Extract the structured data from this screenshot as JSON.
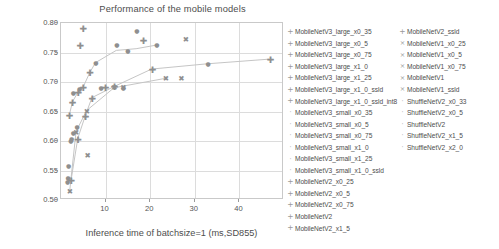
{
  "chart_data": {
    "type": "scatter",
    "title": "Performance of the mobile models",
    "xlabel": "Inference time of batchsize=1  (ms,SD855)",
    "ylabel": "Accuracy",
    "xlim": [
      0,
      50
    ],
    "ylim": [
      0.5,
      0.8
    ],
    "xticks": [
      10,
      20,
      30,
      40
    ],
    "xtick_labels": [
      "10",
      "20",
      "30",
      "40"
    ],
    "yticks": [
      0.5,
      0.55,
      0.6,
      0.65,
      0.7,
      0.75,
      0.8
    ],
    "ytick_labels": [
      "0.50",
      "0.55",
      "0.60",
      "0.65",
      "0.70",
      "0.75",
      "0.80"
    ],
    "grid": true,
    "legend_position": "right",
    "marker_color": "#8f8f8f",
    "line_color": "#c4c4c4",
    "series": [
      {
        "name": "MobileNetV3_large_x0_35",
        "marker": "plus",
        "x": 1.9,
        "y": 0.643
      },
      {
        "name": "MobileNetV3_large_x0_5",
        "marker": "plus",
        "x": 2.6,
        "y": 0.665
      },
      {
        "name": "MobileNetV3_large_x0_75",
        "marker": "plus",
        "x": 3.9,
        "y": 0.682
      },
      {
        "name": "MobileNetV3_large_x1_0",
        "marker": "plus",
        "x": 5.0,
        "y": 0.69
      },
      {
        "name": "MobileNetV3_large_x1_25",
        "marker": "plus",
        "x": 6.5,
        "y": 0.715
      },
      {
        "name": "MobileNetV3_large_x1_0_ssld",
        "marker": "plus",
        "x": 5.0,
        "y": 0.79
      },
      {
        "name": "MobileNetV3_large_x1_0_ssld_int8",
        "marker": "plus",
        "x": 4.3,
        "y": 0.761
      },
      {
        "name": "MobileNetV3_small_x0_35",
        "marker": "dot",
        "x": 1.5,
        "y": 0.53
      },
      {
        "name": "MobileNetV3_small_x0_5",
        "marker": "dot",
        "x": 1.7,
        "y": 0.558
      },
      {
        "name": "MobileNetV3_small_x0_75",
        "marker": "dot",
        "x": 2.2,
        "y": 0.6
      },
      {
        "name": "MobileNetV3_small_x1_0",
        "marker": "dot",
        "x": 2.8,
        "y": 0.613
      },
      {
        "name": "MobileNetV3_small_x1_25",
        "marker": "dot",
        "x": 3.6,
        "y": 0.624
      },
      {
        "name": "MobileNetV3_small_x1_0_ssld",
        "marker": "dot",
        "x": 2.8,
        "y": 0.682
      },
      {
        "name": "MobileNetV2_x0_25",
        "marker": "plus",
        "x": 2.3,
        "y": 0.532
      },
      {
        "name": "MobileNetV2_x0_5",
        "marker": "plus",
        "x": 3.8,
        "y": 0.602
      },
      {
        "name": "MobileNetV2_x0_75",
        "marker": "plus",
        "x": 5.5,
        "y": 0.641
      },
      {
        "name": "MobileNetV2",
        "marker": "plus",
        "x": 7.0,
        "y": 0.672
      },
      {
        "name": "MobileNetV2_x1_5",
        "marker": "plus",
        "x": 12.0,
        "y": 0.691
      },
      {
        "name": "MobileNetV2_ssld",
        "marker": "plus",
        "x": 20.5,
        "y": 0.721
      },
      {
        "name": "MobileNetV1_x0_25",
        "marker": "cross",
        "x": 2.0,
        "y": 0.514
      },
      {
        "name": "MobileNetV1_x0_5",
        "marker": "cross",
        "x": 3.4,
        "y": 0.614
      },
      {
        "name": "MobileNetV1_x0_75",
        "marker": "cross",
        "x": 5.8,
        "y": 0.65
      },
      {
        "name": "MobileNetV1",
        "marker": "cross",
        "x": 12.0,
        "y": 0.689
      },
      {
        "name": "MobileNetV1_ssld",
        "marker": "cross",
        "x": 23.5,
        "y": 0.705
      },
      {
        "name": "ShuffleNetV2_x0_33",
        "marker": "dot",
        "x": 1.6,
        "y": 0.537
      },
      {
        "name": "ShuffleNetV2_x0_5",
        "marker": "dot",
        "x": 2.4,
        "y": 0.603
      },
      {
        "name": "ShuffleNetV2",
        "marker": "dot",
        "x": 4.2,
        "y": 0.688
      },
      {
        "name": "ShuffleNetV2_x1_5",
        "marker": "dot",
        "x": 7.8,
        "y": 0.732
      },
      {
        "name": "ShuffleNetV2_x2_0",
        "marker": "dot",
        "x": 12.5,
        "y": 0.762
      },
      {
        "name": "extra_1",
        "marker": "dot",
        "x": 15.0,
        "y": 0.753
      },
      {
        "name": "extra_2",
        "marker": "plus",
        "x": 18.5,
        "y": 0.769
      },
      {
        "name": "extra_3",
        "marker": "dot",
        "x": 21.5,
        "y": 0.762
      },
      {
        "name": "extra_4",
        "marker": "cross",
        "x": 28.0,
        "y": 0.772
      },
      {
        "name": "extra_5",
        "marker": "dot",
        "x": 33.0,
        "y": 0.73
      },
      {
        "name": "extra_6",
        "marker": "plus",
        "x": 47.0,
        "y": 0.738
      },
      {
        "name": "extra_7",
        "marker": "dot",
        "x": 17.0,
        "y": 0.786
      },
      {
        "name": "extra_8",
        "marker": "dot",
        "x": 14.0,
        "y": 0.69
      },
      {
        "name": "extra_9",
        "marker": "cross",
        "x": 14.0,
        "y": 0.689
      },
      {
        "name": "extra_10",
        "marker": "cross",
        "x": 27.0,
        "y": 0.705
      },
      {
        "name": "extra_11",
        "marker": "dot",
        "x": 9.0,
        "y": 0.689
      },
      {
        "name": "extra_12",
        "marker": "plus",
        "x": 10.0,
        "y": 0.69
      },
      {
        "name": "extra_13",
        "marker": "cross",
        "x": 6.0,
        "y": 0.574
      }
    ],
    "trend_lines": [
      {
        "name": "mobilenetv3-large-trend",
        "points": [
          [
            1.9,
            0.643
          ],
          [
            2.6,
            0.665
          ],
          [
            3.9,
            0.682
          ],
          [
            5.0,
            0.69
          ],
          [
            6.5,
            0.715
          ],
          [
            7.8,
            0.732
          ],
          [
            12.5,
            0.753
          ],
          [
            17.0,
            0.756
          ],
          [
            21.5,
            0.762
          ]
        ]
      },
      {
        "name": "mobilenetv2-trend",
        "points": [
          [
            2.3,
            0.532
          ],
          [
            3.8,
            0.602
          ],
          [
            5.5,
            0.641
          ],
          [
            7.0,
            0.672
          ],
          [
            12.0,
            0.691
          ],
          [
            20.5,
            0.721
          ],
          [
            33.0,
            0.73
          ],
          [
            47.0,
            0.738
          ]
        ]
      },
      {
        "name": "mobilenetv1-trend",
        "points": [
          [
            2.0,
            0.514
          ],
          [
            3.4,
            0.614
          ],
          [
            5.8,
            0.65
          ],
          [
            12.0,
            0.689
          ],
          [
            23.5,
            0.705
          ]
        ]
      }
    ]
  },
  "legend": {
    "columns": [
      [
        {
          "marker": "+",
          "label": "MobileNetV3_large_x0_35"
        },
        {
          "marker": "+",
          "label": "MobileNetV3_large_x0_5"
        },
        {
          "marker": "+",
          "label": "MobileNetV3_large_x0_75"
        },
        {
          "marker": "+",
          "label": "MobileNetV3_large_x1_0"
        },
        {
          "marker": "+",
          "label": "MobileNetV3_large_x1_25"
        },
        {
          "marker": "+",
          "label": "MobileNetV3_large_x1_0_ssld"
        },
        {
          "marker": "+",
          "label": "MobileNetV3_large_x1_0_ssld_int8"
        },
        {
          "marker": "·",
          "label": "MobileNetV3_small_x0_35"
        },
        {
          "marker": "·",
          "label": "MobileNetV3_small_x0_5"
        },
        {
          "marker": "·",
          "label": "MobileNetV3_small_x0_75"
        },
        {
          "marker": "·",
          "label": "MobileNetV3_small_x1_0"
        },
        {
          "marker": "·",
          "label": "MobileNetV3_small_x1_25"
        },
        {
          "marker": "·",
          "label": "MobileNetV3_small_x1_0_ssld"
        },
        {
          "marker": "+",
          "label": "MobileNetV2_x0_25"
        },
        {
          "marker": "+",
          "label": "MobileNetV2_x0_5"
        },
        {
          "marker": "+",
          "label": "MobileNetV2_x0_75"
        },
        {
          "marker": "+",
          "label": "MobileNetV2"
        },
        {
          "marker": "+",
          "label": "MobileNetV2_x1_5"
        }
      ],
      [
        {
          "marker": "+",
          "label": "MobileNetV2_ssld"
        },
        {
          "marker": "×",
          "label": "MobileNetV1_x0_25"
        },
        {
          "marker": "×",
          "label": "MobileNetV1_x0_5"
        },
        {
          "marker": "×",
          "label": "MobileNetV1_x0_75"
        },
        {
          "marker": "×",
          "label": "MobileNetV1"
        },
        {
          "marker": "×",
          "label": "MobileNetV1_ssld"
        },
        {
          "marker": "·",
          "label": "ShuffleNetV2_x0_33"
        },
        {
          "marker": "·",
          "label": "ShuffleNetV2_x0_5"
        },
        {
          "marker": "·",
          "label": "ShuffleNetV2"
        },
        {
          "marker": "·",
          "label": "ShuffleNetV2_x1_5"
        },
        {
          "marker": "·",
          "label": "ShuffleNetV2_x2_0"
        }
      ]
    ]
  }
}
